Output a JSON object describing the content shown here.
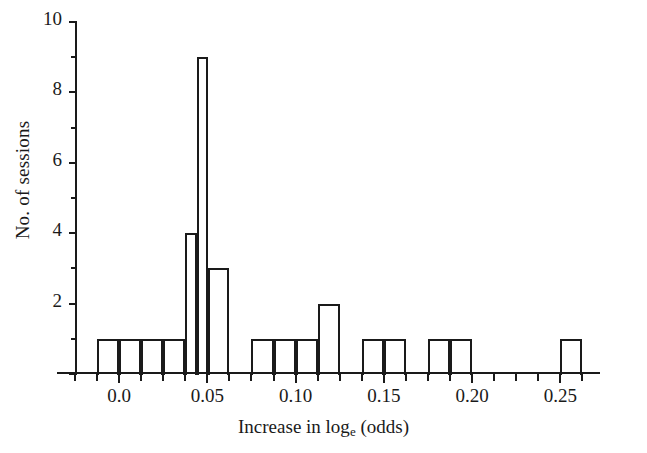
{
  "chart_data": {
    "type": "bar",
    "title": "",
    "subtitle": "",
    "xlabel_prefix": "Increase in log",
    "xlabel_sub": "e",
    "xlabel_suffix": " (odds)",
    "xlabel": "Increase in log_e (odds)",
    "ylabel": "No. of sessions",
    "grid": false,
    "legend": false,
    "bin_width": 0.0125,
    "xlim": [
      -0.025,
      0.2725
    ],
    "ylim": [
      0,
      10
    ],
    "x_major_ticks": [
      0.0,
      0.05,
      0.1,
      0.15,
      0.2,
      0.25
    ],
    "x_major_tick_labels": [
      "0.0",
      "0.05",
      "0.10",
      "0.15",
      "0.20",
      "0.25"
    ],
    "x_minor_tick_step": 0.0125,
    "y_major_ticks": [
      0,
      2,
      4,
      6,
      8,
      10
    ],
    "y_major_tick_labels": [
      "",
      "2",
      "4",
      "6",
      "8",
      "10"
    ],
    "y_minor_ticks": [
      1,
      3,
      5,
      7,
      9
    ],
    "bin_starts": [
      -0.0125,
      0.0,
      0.0125,
      0.025,
      0.0375,
      0.05,
      0.0625,
      0.075,
      0.0875,
      0.1,
      0.1125,
      0.125,
      0.1375,
      0.15,
      0.1625,
      0.175,
      0.1875,
      0.2,
      0.2125,
      0.225,
      0.2375,
      0.25
    ],
    "values": [
      1,
      1,
      1,
      1,
      4,
      9,
      3,
      0,
      1,
      1,
      1,
      2,
      0,
      1,
      1,
      0,
      0,
      1,
      1,
      0,
      0,
      1
    ],
    "bars": [
      {
        "x0": -0.0125,
        "x1": 0.0,
        "y": 1
      },
      {
        "x0": 0.0,
        "x1": 0.0125,
        "y": 1
      },
      {
        "x0": 0.0125,
        "x1": 0.025,
        "y": 1
      },
      {
        "x0": 0.025,
        "x1": 0.0375,
        "y": 1
      },
      {
        "x0": 0.0375,
        "x1": 0.044,
        "y": 4
      },
      {
        "x0": 0.044,
        "x1": 0.0505,
        "y": 9
      },
      {
        "x0": 0.0505,
        "x1": 0.0625,
        "y": 3
      },
      {
        "x0": 0.075,
        "x1": 0.0875,
        "y": 1
      },
      {
        "x0": 0.0875,
        "x1": 0.1,
        "y": 1
      },
      {
        "x0": 0.1,
        "x1": 0.1125,
        "y": 1
      },
      {
        "x0": 0.1125,
        "x1": 0.125,
        "y": 2
      },
      {
        "x0": 0.1375,
        "x1": 0.15,
        "y": 1
      },
      {
        "x0": 0.15,
        "x1": 0.1625,
        "y": 1
      },
      {
        "x0": 0.175,
        "x1": 0.1875,
        "y": 1
      },
      {
        "x0": 0.1875,
        "x1": 0.2,
        "y": 1
      },
      {
        "x0": 0.25,
        "x1": 0.2625,
        "y": 1
      }
    ],
    "accent_color": "#1a1a1a",
    "background_color": "#ffffff"
  }
}
